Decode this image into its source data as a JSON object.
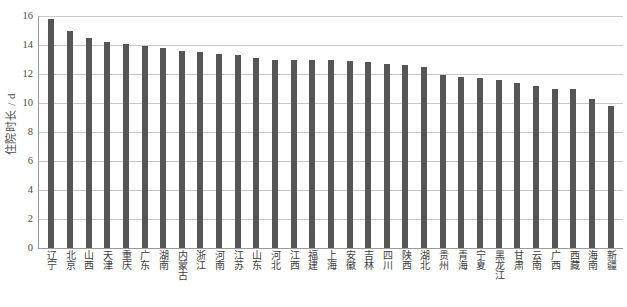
{
  "chart_data": {
    "type": "bar",
    "title": "",
    "xlabel": "",
    "ylabel": "住院时长 / d",
    "ylim": [
      0,
      16
    ],
    "yticks": [
      0,
      2,
      4,
      6,
      8,
      10,
      12,
      14,
      16
    ],
    "grid": true,
    "legend": null,
    "bar_color": "#565656",
    "categories": [
      "辽宁",
      "北京",
      "山西",
      "天津",
      "重庆",
      "广东",
      "湖南",
      "内蒙古",
      "浙江",
      "河南",
      "江苏",
      "山东",
      "河北",
      "江西",
      "福建",
      "上海",
      "安徽",
      "吉林",
      "四川",
      "陕西",
      "湖北",
      "贵州",
      "青海",
      "宁夏",
      "黑龙江",
      "甘肃",
      "云南",
      "广西",
      "西藏",
      "海南",
      "新疆"
    ],
    "values": [
      15.8,
      15.0,
      14.5,
      14.2,
      14.1,
      13.9,
      13.8,
      13.6,
      13.5,
      13.4,
      13.3,
      13.1,
      13.0,
      13.0,
      13.0,
      13.0,
      12.9,
      12.8,
      12.7,
      12.6,
      12.5,
      11.9,
      11.8,
      11.7,
      11.6,
      11.4,
      11.2,
      11.0,
      11.0,
      10.3,
      9.8
    ]
  }
}
